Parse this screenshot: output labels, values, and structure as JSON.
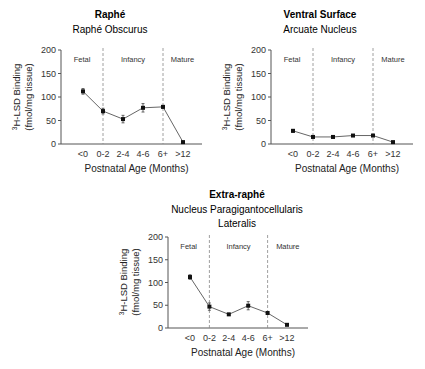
{
  "chart_data": [
    {
      "type": "line",
      "title": "Raphé",
      "subtitle": "Raphé Obscurus",
      "xlabel": "Postnatal Age (Months)",
      "ylabel_line1": "3H-LSD Binding",
      "ylabel_line2": "(fmol/mg tissue)",
      "categories": [
        "<0",
        "0-2",
        "2-4",
        "4-6",
        "6+",
        ">12"
      ],
      "values": [
        112,
        70,
        53,
        77,
        79,
        4
      ],
      "errors": [
        6,
        6,
        8,
        9,
        3,
        1
      ],
      "ylim": [
        0,
        200
      ],
      "yticks": [
        0,
        50,
        100,
        150,
        200
      ],
      "regions": [
        "Fetal",
        "Infancy",
        "Mature"
      ],
      "dividers_at": [
        "0-2",
        "6+"
      ]
    },
    {
      "type": "line",
      "title": "Ventral Surface",
      "subtitle": "Arcuate Nucleus",
      "xlabel": "Postnatal Age (Months)",
      "ylabel_line1": "3H-LSD Binding",
      "ylabel_line2": "(fmol/mg tissue)",
      "categories": [
        "<0",
        "0-2",
        "2-4",
        "4-6",
        "6+",
        ">12"
      ],
      "values": [
        28,
        15,
        15,
        18,
        18,
        4
      ],
      "errors": [
        3,
        2,
        2,
        2,
        2,
        1
      ],
      "ylim": [
        0,
        200
      ],
      "yticks": [
        0,
        50,
        100,
        150,
        200
      ],
      "regions": [
        "Fetal",
        "Infancy",
        "Mature"
      ],
      "dividers_at": [
        "0-2",
        "6+"
      ]
    },
    {
      "type": "line",
      "title": "Extra-raphé",
      "subtitle": "Nucleus Paragigantocellularis",
      "subtitle2": "Lateralis",
      "xlabel": "Postnatal Age (Months)",
      "ylabel_line1": "3H-LSD Binding",
      "ylabel_line2": "(fmol/mg tissue)",
      "categories": [
        "<0",
        "0-2",
        "2-4",
        "4-6",
        "6+",
        ">12"
      ],
      "values": [
        112,
        47,
        30,
        49,
        33,
        7
      ],
      "errors": [
        5,
        8,
        2,
        9,
        2,
        1
      ],
      "ylim": [
        0,
        200
      ],
      "yticks": [
        0,
        50,
        100,
        150,
        200
      ],
      "regions": [
        "Fetal",
        "Infancy",
        "Mature"
      ],
      "dividers_at": [
        "0-2",
        "6+"
      ]
    }
  ],
  "colors": {
    "line": "#666666",
    "point": "#111111",
    "divider": "#888888",
    "axis": "#555555"
  }
}
